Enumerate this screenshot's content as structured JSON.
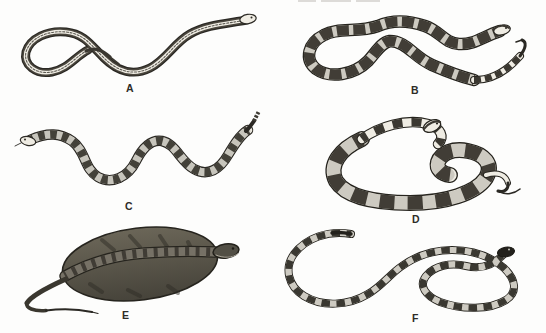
{
  "figure": {
    "background_color": "#fdfdfc",
    "ink_color": "#2b2924",
    "paper_light_color": "#f0ede4",
    "panels": [
      {
        "label": "A",
        "illustration_name": "slender-striped-snake-illustration"
      },
      {
        "label": "B",
        "illustration_name": "blotched-snake-illustration"
      },
      {
        "label": "C",
        "illustration_name": "rattlesnake-illustration"
      },
      {
        "label": "D",
        "illustration_name": "broad-banded-coiled-snake-illustration"
      },
      {
        "label": "E",
        "illustration_name": "dark-heavy-bodied-coiled-snake-illustration"
      },
      {
        "label": "F",
        "illustration_name": "ring-banded-snake-illustration"
      }
    ]
  }
}
